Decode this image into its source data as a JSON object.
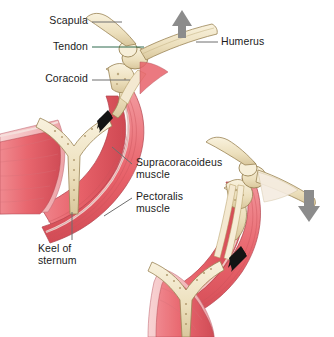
{
  "figure": {
    "background_color": "#ffffff",
    "width": 334,
    "height": 337
  },
  "palette": {
    "bone": "#efe2c0",
    "bone_light": "#f7efd9",
    "bone_shadow": "#d8c499",
    "bone_outline": "#9a8456",
    "muscle": "#e8626a",
    "muscle_dark": "#c9414c",
    "muscle_light": "#f29aa0",
    "muscle_pale": "#f6c3c4",
    "tendon": "#f2e7cf",
    "arrow_gray": "#8c8c8c",
    "arrow_black": "#141414",
    "leader_gray": "#6e6e6e",
    "leader_green": "#2f6b4f",
    "text": "#1b1b1b"
  },
  "labels": [
    {
      "id": "scapula",
      "text": "Scapula",
      "leader_color": "#6e6e6e",
      "x": 48,
      "y": 15,
      "align": "right"
    },
    {
      "id": "tendon",
      "text": "Tendon",
      "leader_color": "#2f6b4f",
      "x": 48,
      "y": 41,
      "align": "right"
    },
    {
      "id": "coracoid",
      "text": "Coracoid",
      "leader_color": "#6e6e6e",
      "x": 48,
      "y": 73,
      "align": "right"
    },
    {
      "id": "humerus",
      "text": "Humerus",
      "leader_color": "#6e6e6e",
      "x": 221,
      "y": 36,
      "align": "left"
    },
    {
      "id": "supracoracoideus",
      "text": "Supracoracoideus\nmuscle",
      "leader_color": "#6e6e6e",
      "x": 134,
      "y": 161,
      "align": "left"
    },
    {
      "id": "pectoralis",
      "text": "Pectoralis\nmuscle",
      "leader_color": "#6e6e6e",
      "x": 134,
      "y": 195,
      "align": "left"
    },
    {
      "id": "keel-of-sternum",
      "text": "Keel of\nsternum",
      "leader_color": "#6e6e6e",
      "x": 38,
      "y": 243,
      "align": "left"
    }
  ],
  "arrows": [
    {
      "id": "upstroke-wing-arrow",
      "color": "#8c8c8c",
      "direction": "up",
      "figure": "left",
      "meaning": "wing moves up"
    },
    {
      "id": "supracoracoideus-pull",
      "color": "#141414",
      "direction": "down-left",
      "figure": "left",
      "meaning": "supracoracoideus contracts"
    },
    {
      "id": "downstroke-wing-arrow",
      "color": "#8c8c8c",
      "direction": "down",
      "figure": "right",
      "meaning": "wing moves down"
    },
    {
      "id": "pectoralis-pull",
      "color": "#141414",
      "direction": "down-left",
      "figure": "right",
      "meaning": "pectoralis contracts"
    }
  ],
  "structures": [
    {
      "id": "scapula-bone",
      "name": "scapula"
    },
    {
      "id": "humerus-bone",
      "name": "humerus"
    },
    {
      "id": "coracoid-bone",
      "name": "coracoid"
    },
    {
      "id": "tendon-band",
      "name": "supracoracoideus tendon"
    },
    {
      "id": "sternum-keel-bone",
      "name": "keel of sternum"
    },
    {
      "id": "pectoralis-muscle",
      "name": "pectoralis muscle"
    },
    {
      "id": "supracoracoideus-muscle",
      "name": "supracoracoideus muscle"
    }
  ]
}
